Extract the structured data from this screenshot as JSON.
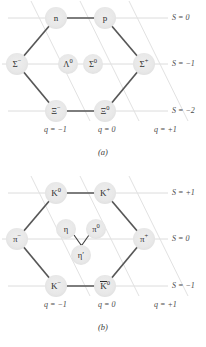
{
  "figure": {
    "type": "su3-weight-diagrams",
    "panels": [
      {
        "id": "a",
        "caption": "(a)",
        "title": "baryon octet",
        "strangeness_rows": [
          {
            "label": "S = 0",
            "value": 0
          },
          {
            "label": "S = −1",
            "value": -1
          },
          {
            "label": "S = −2",
            "value": -2
          }
        ],
        "charge_axes": [
          {
            "label": "q = −1",
            "value": -1
          },
          {
            "label": "q = 0",
            "value": 0
          },
          {
            "label": "q = +1",
            "value": 1
          }
        ],
        "particles": [
          {
            "name": "n",
            "base": "n",
            "sup": "",
            "overline": false,
            "q": -1,
            "S": 0,
            "x": 56,
            "y": 18
          },
          {
            "name": "p",
            "base": "p",
            "sup": "",
            "overline": false,
            "q": 0,
            "S": 0,
            "x": 105,
            "y": 18
          },
          {
            "name": "Sigma-",
            "base": "Σ",
            "sup": "−",
            "overline": false,
            "q": -1,
            "S": -1,
            "x": 17,
            "y": 64
          },
          {
            "name": "Lambda0",
            "base": "Λ",
            "sup": "0",
            "overline": false,
            "q": -1,
            "S": -1,
            "x": 68,
            "y": 64
          },
          {
            "name": "Sigma0",
            "base": "Σ",
            "sup": "0",
            "overline": false,
            "q": 0,
            "S": -1,
            "x": 93,
            "y": 64
          },
          {
            "name": "Sigma+",
            "base": "Σ",
            "sup": "+",
            "overline": false,
            "q": 1,
            "S": -1,
            "x": 144,
            "y": 64
          },
          {
            "name": "Xi-",
            "base": "Ξ",
            "sup": "−",
            "overline": false,
            "q": -1,
            "S": -2,
            "x": 56,
            "y": 111
          },
          {
            "name": "Xi0",
            "base": "Ξ",
            "sup": "0",
            "overline": false,
            "q": 0,
            "S": -2,
            "x": 105,
            "y": 111
          }
        ]
      },
      {
        "id": "b",
        "caption": "(b)",
        "title": "meson nonet",
        "strangeness_rows": [
          {
            "label": "S = +1",
            "value": 1
          },
          {
            "label": "S = 0",
            "value": 0
          },
          {
            "label": "S = −1",
            "value": -1
          }
        ],
        "charge_axes": [
          {
            "label": "q = −1",
            "value": -1
          },
          {
            "label": "q = 0",
            "value": 0
          },
          {
            "label": "q = +1",
            "value": 1
          }
        ],
        "particles": [
          {
            "name": "K0",
            "base": "K",
            "sup": "0",
            "overline": false,
            "q": -1,
            "S": 1,
            "x": 56,
            "y": 18
          },
          {
            "name": "K+",
            "base": "K",
            "sup": "+",
            "overline": false,
            "q": 0,
            "S": 1,
            "x": 105,
            "y": 18
          },
          {
            "name": "pi-",
            "base": "π",
            "sup": "−",
            "overline": false,
            "q": -1,
            "S": 0,
            "x": 17,
            "y": 64
          },
          {
            "name": "eta",
            "base": "η",
            "sup": "",
            "overline": false,
            "q": -1,
            "S": 0,
            "x": 66,
            "y": 54
          },
          {
            "name": "pi0",
            "base": "π",
            "sup": "0",
            "overline": false,
            "q": 0,
            "S": 0,
            "x": 96,
            "y": 54
          },
          {
            "name": "eta-prime",
            "base": "η′",
            "sup": "",
            "overline": false,
            "q": 0,
            "S": 0,
            "x": 81,
            "y": 80
          },
          {
            "name": "pi+",
            "base": "π",
            "sup": "+",
            "overline": false,
            "q": 1,
            "S": 0,
            "x": 144,
            "y": 64
          },
          {
            "name": "K-",
            "base": "K",
            "sup": "−",
            "overline": false,
            "q": -1,
            "S": -1,
            "x": 56,
            "y": 111
          },
          {
            "name": "K0bar",
            "base": "K",
            "sup": "0",
            "overline": true,
            "q": 0,
            "S": -1,
            "x": 105,
            "y": 111
          }
        ]
      }
    ],
    "colors": {
      "hexagon_edge": "#555555",
      "axis_line": "#d9d9d9",
      "node_fill": "#e8e8e8",
      "text": "#2f2f2f",
      "background": "#ffffff"
    }
  }
}
